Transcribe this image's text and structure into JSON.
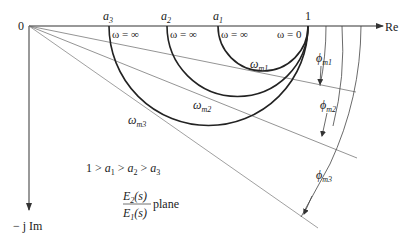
{
  "diagram": {
    "axes": {
      "origin_label": "0",
      "real_axis_label": "Re",
      "imag_axis_label": "− j Im",
      "unit_point_label": "1"
    },
    "points": {
      "a1": {
        "base": "a",
        "sub": "1"
      },
      "a2": {
        "base": "a",
        "sub": "2"
      },
      "a3": {
        "base": "a",
        "sub": "3"
      }
    },
    "omega_labels": {
      "inf": "ω = ∞",
      "zero": "ω = 0"
    },
    "curves": [
      {
        "name": "a1",
        "omega_max": {
          "base": "ω",
          "sub": "m1"
        },
        "phi": {
          "base": "ϕ",
          "sub": "m1"
        }
      },
      {
        "name": "a2",
        "omega_max": {
          "base": "ω",
          "sub": "m2"
        },
        "phi": {
          "base": "ϕ",
          "sub": "m2"
        }
      },
      {
        "name": "a3",
        "omega_max": {
          "base": "ω",
          "sub": "m3"
        },
        "phi": {
          "base": "ϕ",
          "sub": "m3"
        }
      }
    ],
    "inequality": {
      "text_1": "1 > ",
      "a1": "a",
      "s1": "1",
      "gt": " > ",
      "a2": "a",
      "s2": "2",
      "gt2": " > ",
      "a3": "a",
      "s3": "3"
    },
    "plane_label": {
      "numerator": "E",
      "numerator_sub": "2",
      "numerator_arg": "(s)",
      "denominator": "E",
      "denominator_sub": "1",
      "denominator_arg": "(s)",
      "suffix": "plane"
    }
  }
}
